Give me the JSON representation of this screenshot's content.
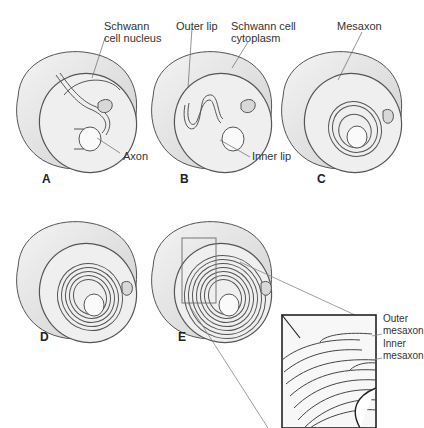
{
  "figure": {
    "colors": {
      "outline": "#555555",
      "cell_fill": "#eeeeee",
      "shade": "#cfcfcf",
      "inset_border": "#333333",
      "leader": "#777777"
    },
    "panels": [
      {
        "id": "A",
        "letter": "A",
        "labels": [
          "Schwann cell nucleus",
          "Axon"
        ]
      },
      {
        "id": "B",
        "letter": "B",
        "labels": [
          "Outer lip",
          "Schwann cell cytoplasm",
          "Inner lip"
        ]
      },
      {
        "id": "C",
        "letter": "C",
        "labels": [
          "Mesaxon"
        ]
      },
      {
        "id": "D",
        "letter": "D",
        "labels": []
      },
      {
        "id": "E",
        "letter": "E",
        "labels": [],
        "inset_labels": [
          "Outer mesaxon",
          "Inner mesaxon"
        ]
      }
    ],
    "labels": {
      "schwann_nucleus_1": "Schwann",
      "schwann_nucleus_2": "cell nucleus",
      "axon": "Axon",
      "outer_lip": "Outer lip",
      "schwann_cytoplasm_1": "Schwann cell",
      "schwann_cytoplasm_2": "cytoplasm",
      "inner_lip": "Inner lip",
      "mesaxon": "Mesaxon",
      "outer_mesaxon_1": "Outer",
      "outer_mesaxon_2": "mesaxon",
      "inner_mesaxon_1": "Inner",
      "inner_mesaxon_2": "mesaxon"
    }
  }
}
